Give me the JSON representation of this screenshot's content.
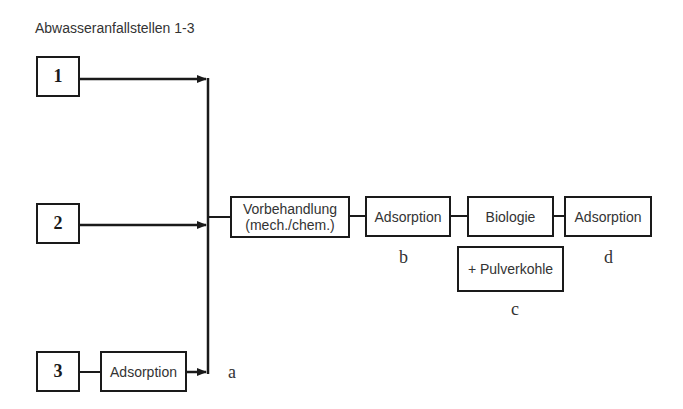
{
  "title": "Abwasseranfallstellen 1-3",
  "sources": [
    {
      "id": "1",
      "label": "1"
    },
    {
      "id": "2",
      "label": "2"
    },
    {
      "id": "3",
      "label": "3"
    }
  ],
  "pre_adsorption": {
    "label": "Adsorption"
  },
  "process_chain": [
    {
      "id": "vorbehandlung",
      "line1": "Vorbehandlung",
      "line2": "(mech./chem.)"
    },
    {
      "id": "adsorption-b",
      "label": "Adsorption"
    },
    {
      "id": "biologie",
      "label": "Biologie"
    },
    {
      "id": "adsorption-d",
      "label": "Adsorption"
    }
  ],
  "pulverkohle": {
    "label": "+ Pulverkohle"
  },
  "position_labels": {
    "a": "a",
    "b": "b",
    "c": "c",
    "d": "d"
  },
  "colors": {
    "line": "#1a1a1a",
    "text": "#333333",
    "background": "#ffffff"
  }
}
